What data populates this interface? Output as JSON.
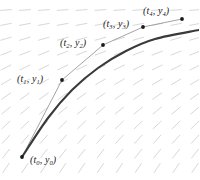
{
  "figure": {
    "width": 199,
    "height": 180,
    "background": "#ffffff",
    "colors": {
      "slope_field": "#d8d8dc",
      "solution_curve": "#3a3a3a",
      "euler_polyline": "#9a9a9a",
      "point_marker": "#1a1a1a",
      "label_text": "#1a1a1a"
    }
  },
  "labels": [
    {
      "id": "p0",
      "var_t": "t",
      "sub_t": "0",
      "var_y": "y",
      "sub_y": "0",
      "text": "(t0, y0)",
      "x": 30,
      "y": 155
    },
    {
      "id": "p1",
      "var_t": "t",
      "sub_t": "1",
      "var_y": "y",
      "sub_y": "1",
      "text": "(t1, y1)",
      "x": 17,
      "y": 74
    },
    {
      "id": "p2",
      "var_t": "t",
      "sub_t": "2",
      "var_y": "y",
      "sub_y": "2",
      "text": "(t2, y2)",
      "x": 60,
      "y": 38
    },
    {
      "id": "p3",
      "var_t": "t",
      "sub_t": "3",
      "var_y": "y",
      "sub_y": "3",
      "text": "(t3, y3)",
      "x": 103,
      "y": 19
    },
    {
      "id": "p4",
      "var_t": "t",
      "sub_t": "4",
      "var_y": "y",
      "sub_y": "4",
      "text": "(t4, y4)",
      "x": 143,
      "y": 6
    }
  ],
  "chart_data": {
    "type": "line",
    "xlabel": "t",
    "ylabel": "y",
    "grid": false,
    "legend": "none",
    "xlim": [
      0,
      199
    ],
    "ylim": [
      180,
      0
    ],
    "series": [
      {
        "name": "Euler polyline",
        "style": "thin-gray-polyline",
        "color": "#9a9a9a",
        "points": [
          {
            "x": 22,
            "y": 157
          },
          {
            "x": 62,
            "y": 80
          },
          {
            "x": 103,
            "y": 45
          },
          {
            "x": 143,
            "y": 27
          },
          {
            "x": 182,
            "y": 19
          }
        ]
      },
      {
        "name": "True solution curve",
        "style": "thick-dark-curve",
        "color": "#3a3a3a",
        "points": [
          {
            "x": 22,
            "y": 157
          },
          {
            "x": 48,
            "y": 118
          },
          {
            "x": 72,
            "y": 90
          },
          {
            "x": 98,
            "y": 68
          },
          {
            "x": 126,
            "y": 51
          },
          {
            "x": 155,
            "y": 39
          },
          {
            "x": 199,
            "y": 30
          }
        ]
      }
    ],
    "markers": [
      {
        "label": "(t0, y0)",
        "x": 22,
        "y": 157
      },
      {
        "label": "(t1, y1)",
        "x": 62,
        "y": 80
      },
      {
        "label": "(t2, y2)",
        "x": 103,
        "y": 45
      },
      {
        "label": "(t3, y3)",
        "x": 143,
        "y": 27
      },
      {
        "label": "(t4, y4)",
        "x": 182,
        "y": 19
      }
    ],
    "slope_field": {
      "description": "Direction field of dashes; nearly horizontal near the top of the plot, steepening to roughly 45-60 degrees toward the lower-left and lower-right",
      "columns": 11,
      "rows": 12,
      "dash_length": 11,
      "color": "#d8d8dc"
    }
  }
}
